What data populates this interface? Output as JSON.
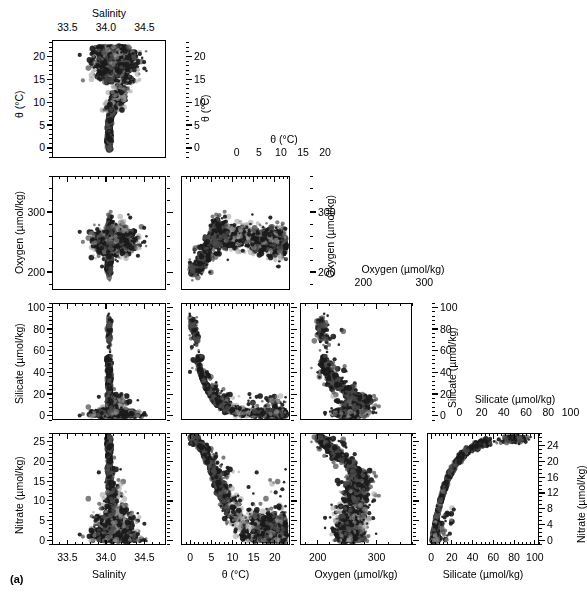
{
  "figure": {
    "caption": "(a)",
    "type": "scatter-plot-matrix",
    "variables": [
      "Salinity",
      "θ (°C)",
      "Oxygen (µmol/kg)",
      "Silicate (µmol/kg)",
      "Nitrate (µmol/kg)"
    ]
  },
  "axes": {
    "salinity": {
      "label": "Salinity",
      "ticks": [
        33.5,
        34.0,
        34.5
      ],
      "tick_labels": [
        "33.5",
        "34.0",
        "34.5"
      ],
      "min": 33.3,
      "max": 34.78,
      "minor": 5
    },
    "theta": {
      "label": "θ (°C)",
      "ticks": [
        0,
        5,
        10,
        15,
        20
      ],
      "tick_labels": [
        "0",
        "5",
        "10",
        "15",
        "20"
      ],
      "min": -2.2,
      "max": 23.6,
      "minor": 5
    },
    "oxygen": {
      "label": "Oxygen (µmol/kg)",
      "ticks": [
        200,
        300
      ],
      "tick_labels": [
        "200",
        "300"
      ],
      "min": 170,
      "max": 360,
      "minor": 5
    },
    "silicate": {
      "label": "Silicate (µmol/kg)",
      "ticks": [
        0,
        20,
        40,
        60,
        80,
        100
      ],
      "tick_labels": [
        "0",
        "20",
        "40",
        "60",
        "80",
        "100"
      ],
      "min": -4,
      "max": 104,
      "minor": 5
    },
    "nitrate_left": {
      "label": "Nitrate (µmol/kg)",
      "ticks": [
        0,
        5,
        10,
        15,
        20,
        25
      ],
      "tick_labels": [
        "0",
        "5",
        "10",
        "15",
        "20",
        "25"
      ],
      "min": -1.2,
      "max": 27.2,
      "minor": 5
    },
    "nitrate_right": {
      "label": "Nitrate (µmol/kg)",
      "ticks": [
        0,
        4,
        8,
        12,
        16,
        20,
        24
      ],
      "tick_labels": [
        "0",
        "4",
        "8",
        "12",
        "16",
        "20",
        "24"
      ],
      "min": -1.2,
      "max": 27.2,
      "minor": 4
    }
  },
  "colors": {
    "ink": "#000000",
    "series_dark": "#1a1a1a",
    "series_mid": "#4d4d4d",
    "series_light": "#9a9a9a",
    "series_pale": "#c4c4c4",
    "frame": "#000000",
    "background": "#ffffff"
  },
  "chart_data": {
    "type": "scatter",
    "title": "",
    "layout": "scatter-plot-matrix (lower triangle) with diagonal variable headers",
    "grid": false,
    "legend": "none",
    "marker": {
      "shape": "circle",
      "sizes_px": [
        2,
        3,
        4,
        5
      ],
      "tones": [
        "#1a1a1a",
        "#4d4d4d",
        "#9a9a9a",
        "#c4c4c4"
      ]
    },
    "variables": [
      {
        "key": "salinity",
        "name": "Salinity",
        "unit": "",
        "range": [
          33.3,
          34.78
        ]
      },
      {
        "key": "theta",
        "name": "θ",
        "unit": "°C",
        "range": [
          -2.2,
          23.6
        ]
      },
      {
        "key": "oxygen",
        "name": "Oxygen",
        "unit": "µmol/kg",
        "range": [
          170,
          360
        ]
      },
      {
        "key": "silicate",
        "name": "Silicate",
        "unit": "µmol/kg",
        "range": [
          -4,
          104
        ]
      },
      {
        "key": "nitrate",
        "name": "Nitrate",
        "unit": "µmol/kg",
        "range": [
          -1.2,
          27.2
        ]
      }
    ],
    "panels": [
      {
        "row": 1,
        "col": 1,
        "x": "salinity",
        "y": "theta",
        "xlabel": "Salinity",
        "ylabel": "θ (°C)",
        "description": "Theta-S diagram: narrow cold low-salinity tail near S=34.05 rising from 0 to 8 C, broad warm cluster 15-22 C spanning S=33.9-34.6"
      },
      {
        "row": 2,
        "col": 1,
        "x": "salinity",
        "y": "oxygen",
        "xlabel": "Salinity",
        "ylabel": "Oxygen (µmol/kg)",
        "description": "Vertical spike near S=34.05 from 190 to 350; broad cloud 220-280 across salinity"
      },
      {
        "row": 2,
        "col": 2,
        "x": "theta",
        "y": "oxygen",
        "xlabel": "θ (°C)",
        "ylabel": "Oxygen (µmol/kg)",
        "description": "High oxygen 300-350 at low theta 0-5; declining cloud to 230-270 at theta 10-22"
      },
      {
        "row": 3,
        "col": 1,
        "x": "salinity",
        "y": "silicate",
        "xlabel": "Salinity",
        "ylabel": "Silicate (µmol/kg)",
        "description": "Tall narrow spike at S=34.05 reaching 93; low scatter 0-25 elsewhere"
      },
      {
        "row": 3,
        "col": 2,
        "x": "theta",
        "y": "silicate",
        "xlabel": "θ (°C)",
        "ylabel": "Silicate (µmol/kg)",
        "description": "Steep decay: silicate 93 at theta 0 falling to <10 by theta 10"
      },
      {
        "row": 3,
        "col": 3,
        "x": "oxygen",
        "y": "silicate",
        "xlabel": "Oxygen (µmol/kg)",
        "ylabel": "Silicate (µmol/kg)",
        "description": "Silicate high 80-95 near oxygen 205-225, spreading to 5-40 at oxygen 250-340"
      },
      {
        "row": 4,
        "col": 1,
        "x": "salinity",
        "y": "nitrate",
        "xlabel": "Salinity",
        "ylabel": "Nitrate (µmol/kg)",
        "description": "Narrow vertical spike at S=34.05 to 26; scattered 0-8 at higher salinity"
      },
      {
        "row": 4,
        "col": 2,
        "x": "theta",
        "y": "nitrate",
        "xlabel": "θ (°C)",
        "ylabel": "Nitrate (µmol/kg)",
        "description": "Monotonic decrease: nitrate 26 at theta 0 to near 0 at theta 18-22"
      },
      {
        "row": 4,
        "col": 3,
        "x": "oxygen",
        "y": "nitrate",
        "xlabel": "Oxygen (µmol/kg)",
        "ylabel": "Nitrate (µmol/kg)",
        "description": "Nitrate 24-26 at oxygen 200-215 descending to 0-10 at oxygen 280-350"
      },
      {
        "row": 4,
        "col": 4,
        "x": "silicate",
        "y": "nitrate",
        "xlabel": "Silicate (µmol/kg)",
        "ylabel": "Nitrate (µmol/kg)",
        "description": "Tight saturating curve: nitrate rises steeply 0-20 for silicate 0-30 then plateaus at 24-26 for silicate 50-95"
      }
    ],
    "diagonal_headers": [
      {
        "index": 1,
        "variable": "θ (°C)",
        "axis_ticks": [
          "0",
          "5",
          "10",
          "15",
          "20"
        ]
      },
      {
        "index": 2,
        "variable": "Oxygen (µmol/kg)",
        "axis_ticks": [
          "200",
          "300"
        ]
      },
      {
        "index": 3,
        "variable": "Silicate (µmol/kg)",
        "axis_ticks": [
          "0",
          "20",
          "40",
          "60",
          "80",
          "100"
        ]
      },
      {
        "index": 4,
        "variable": "Nitrate (µmol/kg)",
        "axis_ticks": [
          "0",
          "4",
          "8",
          "12",
          "16",
          "20",
          "24"
        ]
      }
    ]
  }
}
